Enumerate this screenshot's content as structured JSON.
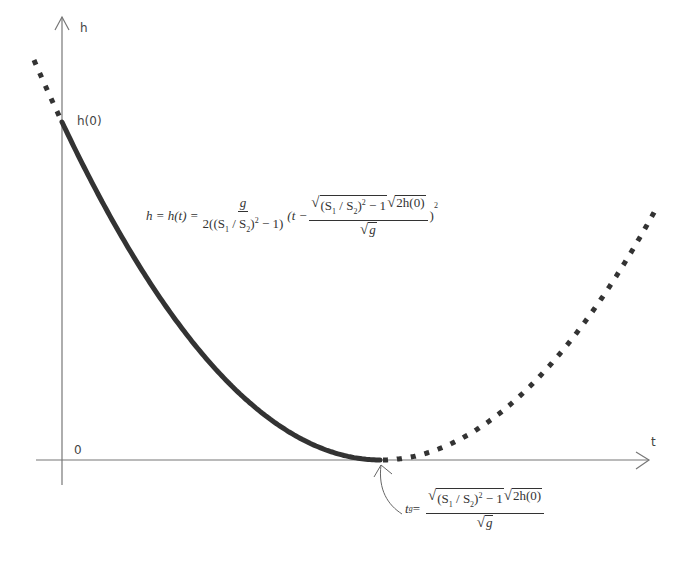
{
  "axes": {
    "x_label": "t",
    "y_label": "h",
    "origin_label": "0",
    "intercept_label": "h(0)"
  },
  "curve": {
    "type": "parabola",
    "description": "h(t) decreasing from h(0) to zero at t_g, with dotted extensions beyond domain",
    "solid_segment": "from t=0 to t=t_g",
    "dotted_segments": [
      "t<0",
      "t>t_g"
    ],
    "color": "#333333"
  },
  "equation_main": {
    "lhs": "h = h(t) =",
    "frac1_num": "g",
    "frac1_den_pre": "2((S",
    "frac1_den_sub1": "1",
    "frac1_den_mid": " / S",
    "frac1_den_sub2": "2",
    "frac1_den_post": ")",
    "frac1_den_sup": "2",
    "frac1_den_tail": " − 1)",
    "paren_open": "(t −",
    "frac2_sqrt1_pre": "(S",
    "frac2_sqrt1_sub1": "1",
    "frac2_sqrt1_mid": " / S",
    "frac2_sqrt1_sub2": "2",
    "frac2_sqrt1_post": ")",
    "frac2_sqrt1_sup": "2",
    "frac2_sqrt1_tail": " − 1",
    "frac2_sqrt2": "2h(0)",
    "frac2_den_sqrt": "g",
    "paren_close": ")",
    "exponent": "2"
  },
  "equation_tg": {
    "lhs": "t",
    "lhs_sub": "g",
    "eq": " =",
    "sqrt1_pre": "(S",
    "sqrt1_sub1": "1",
    "sqrt1_mid": " / S",
    "sqrt1_sub2": "2",
    "sqrt1_post": ")",
    "sqrt1_sup": "2",
    "sqrt1_tail": " − 1",
    "sqrt2": "2h(0)",
    "den_sqrt": "g"
  }
}
